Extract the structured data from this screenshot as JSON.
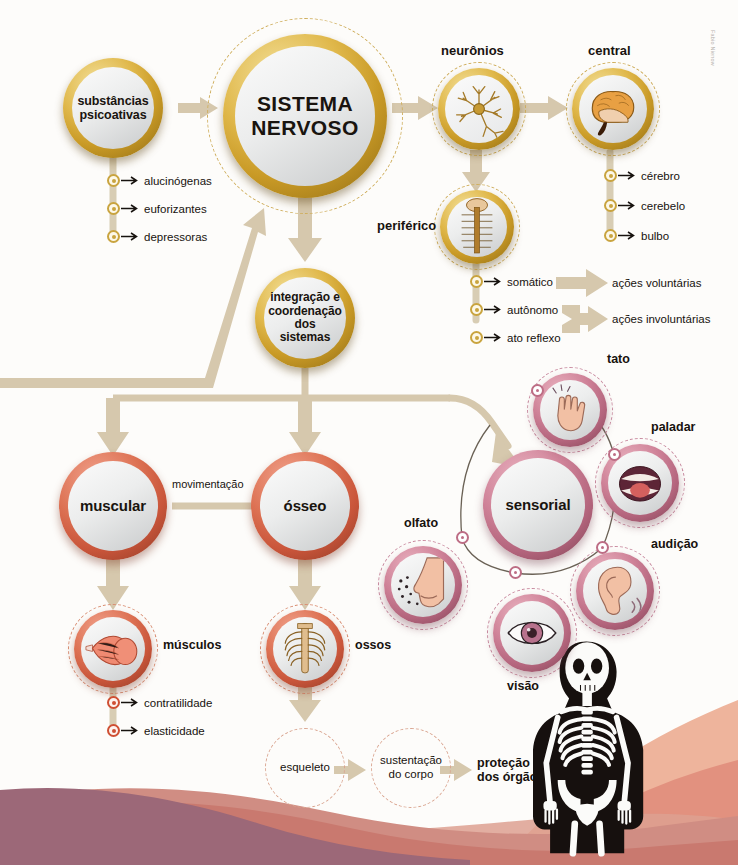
{
  "credit": "Fabio Nienow",
  "nodes": {
    "psicoativas": "substâncias\npsicoativas",
    "sistema_nervoso": "SISTEMA\nNERVOSO",
    "integracao": "integração\ne coordenação\ndos sistemas",
    "muscular": "muscular",
    "osseo": "ósseo",
    "sensorial": "sensorial"
  },
  "labels": {
    "neuronios": "neurônios",
    "central": "central",
    "periferico": "periférico",
    "tato": "tato",
    "paladar": "paladar",
    "audicao": "audição",
    "visao": "visão",
    "olfato": "olfato",
    "musculos": "músculos",
    "ossos": "ossos",
    "movimentacao": "movimentação",
    "acoes_voluntarias": "ações voluntárias",
    "acoes_involuntarias": "ações involuntárias",
    "protecao_orgaos": "proteção\ndos órgãos"
  },
  "bullets": {
    "psicoativas": [
      "alucinógenas",
      "euforizantes",
      "depressoras"
    ],
    "central": [
      "cérebro",
      "cerebelo",
      "bulbo"
    ],
    "periferico": [
      "somático",
      "autônomo",
      "ato reflexo"
    ],
    "musculos": [
      "contratilidade",
      "elasticidade"
    ]
  },
  "dashed_nodes": {
    "esqueleto": "esqueleto",
    "sustentacao": "sustentação\ndo corpo"
  },
  "colors": {
    "gold": "#c99a26",
    "red": "#cf5a3c",
    "pink": "#bd6d85",
    "connector": "#d6c8ad",
    "wave_mauve": "#9c6878",
    "wave_rose": "#c9796f",
    "wave_salmon": "#e2917f",
    "wave_peach": "#eeb49c",
    "text": "#17120e"
  }
}
